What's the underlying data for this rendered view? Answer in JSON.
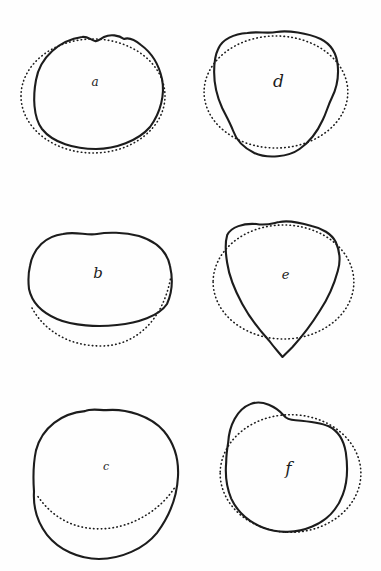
{
  "figure": {
    "paper_color": "#fefefe",
    "ink_color": "#1c1c1c",
    "panels": [
      {
        "id": "a",
        "label": "a",
        "label_x": 95,
        "label_y": 86,
        "label_size": 12,
        "solid_path": "M 36 80 C 40 57 60 40 82 37 C 87 36 91 40 95 41 C 98 42 100 39 104 37 C 110 34 119 35 124 39 C 129 37 135 40 141 45 C 152 53 159 65 162 79 C 165 94 161 112 150 127 C 138 141 115 149 96 149 C 75 149 53 143 42 129 C 33 117 33 96 36 80 Z",
        "dotted_path": "M 21 96 a 72 57 0 1 0 144 0 a 72 57 0 1 0 -144 0"
      },
      {
        "id": "d",
        "label": "d",
        "label_x": 88,
        "label_y": 87,
        "label_size": 17,
        "solid_path": "M 28 49 C 32 39 44 34 57 33 C 68 31 76 34 86 32 C 97 30 117 33 130 39 C 140 44 146 54 147 66 C 148 77 146 88 141 98 C 137 106 136 112 132 120 C 127 131 119 142 109 149 C 98 157 77 159 64 153 C 54 148 46 140 43 131 C 40 123 36 116 32 108 C 27 97 24 85 24 72 C 24 62 25 55 28 49 Z",
        "dotted_path": "M 14 92 a 71.5 56 0 1 0 143 0 a 71.5 56 0 1 0 -143 0"
      },
      {
        "id": "b",
        "label": "b",
        "label_x": 98,
        "label_y": 88,
        "label_size": 15,
        "solid_path": "M 30 76 C 33 58 46 46 63 44 C 76 41 87 46 97 44 C 107 42 124 42 139 46 C 155 51 167 61 170 76 C 173 89 172 103 167 114 C 159 126 138 133 117 135 C 98 137 73 136 57 129 C 43 123 32 113 29 99 C 28 90 28 84 30 76 Z",
        "dotted_path": "M 32 118 C 44 140 68 156 101 156 C 134 156 163 132 171 86"
      },
      {
        "id": "e",
        "label": "e",
        "label_x": 95,
        "label_y": 89,
        "label_size": 13,
        "solid_path": "M 37 45 C 41 37 53 33 66 34 C 76 36 83 33 89 32 C 98 30 111 33 121 36 C 131 38 141 44 145 52 C 149 61 150 71 147 81 C 143 96 137 109 129 121 C 121 134 111 147 102 157 C 98 161 95 164 92 167 C 89 163 84 158 79 151 C 69 140 59 127 52 114 C 45 101 39 87 37 73 C 35 61 35 52 37 45 Z",
        "dotted_path": "M 23 92 a 70 57 0 1 0 140 0 a 70 57 0 1 0 -140 0"
      },
      {
        "id": "c",
        "label": "c",
        "label_x": 106,
        "label_y": 90,
        "label_size": 11,
        "solid_path": "M 36 70 C 42 47 62 33 85 31 C 91 28 99 30 106 30 C 126 28 151 36 164 51 C 174 63 179 77 178 96 C 177 116 169 136 157 152 C 144 168 121 178 99 178 C 79 178 59 169 47 154 C 37 141 33 127 34 111 C 33 97 33 84 36 70 Z",
        "dotted_path": "M 38 116 C 55 140 78 149 103 148 C 130 147 160 131 176 105"
      },
      {
        "id": "f",
        "label": "f",
        "label_x": 98,
        "label_y": 94,
        "label_size": 17,
        "solid_path": "M 38 62 C 39 45 47 29 60 24 C 72 19 86 27 93 35 C 96 39 100 40 105 40 C 117 41 129 42 138 46 C 148 51 153 60 155 72 C 157 86 157 101 152 114 C 147 128 136 140 121 146 C 107 152 88 153 73 147 C 58 141 47 131 41 118 C 36 106 35 93 36 82 C 36 74 37 68 38 62 Z",
        "dotted_path": "M 30 93 a 70 58.5 0 1 0 140 0 a 70 58.5 0 1 0 -140 0"
      }
    ]
  }
}
